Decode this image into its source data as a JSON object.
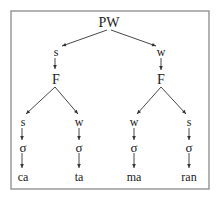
{
  "diagram": {
    "type": "prosodic-tree",
    "frame": {
      "x": 11,
      "y": 11,
      "w": 198,
      "h": 178,
      "color": "#8a8a8a"
    },
    "nodes": [
      {
        "id": "pw",
        "label": "PW",
        "x": 109,
        "y": 22,
        "size": 14
      },
      {
        "id": "s1",
        "label": "s",
        "x": 56,
        "y": 52,
        "size": 12
      },
      {
        "id": "w1",
        "label": "w",
        "x": 161,
        "y": 52,
        "size": 12
      },
      {
        "id": "f1",
        "label": "F",
        "x": 56,
        "y": 79,
        "size": 14
      },
      {
        "id": "f2",
        "label": "F",
        "x": 161,
        "y": 79,
        "size": 14
      },
      {
        "id": "s2",
        "label": "s",
        "x": 23,
        "y": 122,
        "size": 12
      },
      {
        "id": "w2",
        "label": "w",
        "x": 79,
        "y": 122,
        "size": 12
      },
      {
        "id": "w3",
        "label": "w",
        "x": 134,
        "y": 122,
        "size": 12
      },
      {
        "id": "s3",
        "label": "s",
        "x": 189,
        "y": 122,
        "size": 12
      },
      {
        "id": "sg1",
        "label": "σ",
        "x": 23,
        "y": 147,
        "size": 13
      },
      {
        "id": "sg2",
        "label": "σ",
        "x": 79,
        "y": 147,
        "size": 13
      },
      {
        "id": "sg3",
        "label": "σ",
        "x": 134,
        "y": 147,
        "size": 13
      },
      {
        "id": "sg4",
        "label": "σ",
        "x": 189,
        "y": 147,
        "size": 13
      },
      {
        "id": "ca",
        "label": "ca",
        "x": 23,
        "y": 177,
        "size": 12
      },
      {
        "id": "ta",
        "label": "ta",
        "x": 79,
        "y": 177,
        "size": 12
      },
      {
        "id": "ma",
        "label": "ma",
        "x": 134,
        "y": 177,
        "size": 12
      },
      {
        "id": "ran",
        "label": "ran",
        "x": 189,
        "y": 177,
        "size": 12
      }
    ],
    "edges": [
      {
        "from": "pw",
        "to": "s1",
        "x1": 107,
        "y1": 30,
        "x2": 62,
        "y2": 46
      },
      {
        "from": "pw",
        "to": "w1",
        "x1": 111,
        "y1": 30,
        "x2": 156,
        "y2": 46
      },
      {
        "from": "s1",
        "to": "f1",
        "x1": 55,
        "y1": 58,
        "x2": 55,
        "y2": 69
      },
      {
        "from": "w1",
        "to": "f2",
        "x1": 161,
        "y1": 58,
        "x2": 161,
        "y2": 70
      },
      {
        "from": "f1",
        "to": "s2",
        "x1": 55,
        "y1": 87,
        "x2": 26,
        "y2": 114
      },
      {
        "from": "f1",
        "to": "w2",
        "x1": 55,
        "y1": 87,
        "x2": 78,
        "y2": 114
      },
      {
        "from": "f2",
        "to": "w3",
        "x1": 161,
        "y1": 87,
        "x2": 137,
        "y2": 114
      },
      {
        "from": "f2",
        "to": "s3",
        "x1": 161,
        "y1": 87,
        "x2": 186,
        "y2": 114
      },
      {
        "from": "s2",
        "to": "sg1",
        "x1": 22,
        "y1": 128,
        "x2": 22,
        "y2": 140
      },
      {
        "from": "w2",
        "to": "sg2",
        "x1": 79,
        "y1": 128,
        "x2": 79,
        "y2": 140
      },
      {
        "from": "w3",
        "to": "sg3",
        "x1": 134,
        "y1": 128,
        "x2": 134,
        "y2": 140
      },
      {
        "from": "s3",
        "to": "sg4",
        "x1": 189,
        "y1": 128,
        "x2": 189,
        "y2": 140
      },
      {
        "from": "sg1",
        "to": "ca",
        "x1": 22,
        "y1": 153,
        "x2": 22,
        "y2": 168
      },
      {
        "from": "sg2",
        "to": "ta",
        "x1": 79,
        "y1": 153,
        "x2": 79,
        "y2": 168
      },
      {
        "from": "sg3",
        "to": "ma",
        "x1": 134,
        "y1": 153,
        "x2": 134,
        "y2": 168
      },
      {
        "from": "sg4",
        "to": "ran",
        "x1": 189,
        "y1": 153,
        "x2": 189,
        "y2": 168
      }
    ]
  }
}
